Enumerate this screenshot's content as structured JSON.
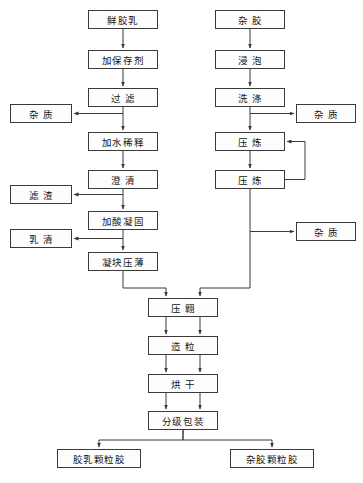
{
  "diagram": {
    "background_color": "#ffffff",
    "line_color": "#3a3a3a",
    "box_fill_color": "#fdfdfd",
    "text_color": "#141414",
    "width": 363,
    "height": 483
  },
  "nodes": {
    "fresh_latex": {
      "label": "鲜胶乳",
      "x": 88,
      "y": 10,
      "w": 70,
      "h": 19,
      "spacing": "tight"
    },
    "add_preservative": {
      "label": "加保存剂",
      "x": 88,
      "y": 50,
      "w": 70,
      "h": 19,
      "spacing": "tight"
    },
    "filtration": {
      "label": "过滤",
      "x": 88,
      "y": 88,
      "w": 70,
      "h": 19,
      "spacing": "wide"
    },
    "impurity_left": {
      "label": "杂质",
      "x": 10,
      "y": 104,
      "w": 62,
      "h": 19,
      "spacing": "wide"
    },
    "dilute_water": {
      "label": "加水稀释",
      "x": 88,
      "y": 132,
      "w": 70,
      "h": 19,
      "spacing": "tight"
    },
    "clarify": {
      "label": "澄清",
      "x": 88,
      "y": 170,
      "w": 70,
      "h": 19,
      "spacing": "wide"
    },
    "filter_residue": {
      "label": "滤渣",
      "x": 10,
      "y": 185,
      "w": 62,
      "h": 19,
      "spacing": "wide"
    },
    "acid_coagulation": {
      "label": "加酸凝固",
      "x": 88,
      "y": 211,
      "w": 70,
      "h": 19,
      "spacing": "tight"
    },
    "whey": {
      "label": "乳清",
      "x": 10,
      "y": 229,
      "w": 62,
      "h": 19,
      "spacing": "wide"
    },
    "coagulum_press": {
      "label": "凝块压薄",
      "x": 88,
      "y": 252,
      "w": 70,
      "h": 19,
      "spacing": "tight"
    },
    "scrap_rubber": {
      "label": "杂胶",
      "x": 215,
      "y": 10,
      "w": 70,
      "h": 19,
      "spacing": "wide"
    },
    "soaking": {
      "label": "浸泡",
      "x": 215,
      "y": 50,
      "w": 70,
      "h": 19,
      "spacing": "wide"
    },
    "washing": {
      "label": "洗涤",
      "x": 215,
      "y": 88,
      "w": 70,
      "h": 19,
      "spacing": "wide"
    },
    "impurity_right_top": {
      "label": "杂质",
      "x": 296,
      "y": 104,
      "w": 60,
      "h": 19,
      "spacing": "wide"
    },
    "mastication_1": {
      "label": "压炼",
      "x": 215,
      "y": 132,
      "w": 70,
      "h": 19,
      "spacing": "wide"
    },
    "mastication_2": {
      "label": "压炼",
      "x": 215,
      "y": 170,
      "w": 70,
      "h": 19,
      "spacing": "wide"
    },
    "impurity_right_bottom": {
      "label": "杂质",
      "x": 296,
      "y": 222,
      "w": 60,
      "h": 19,
      "spacing": "wide"
    },
    "crepe_press": {
      "label": "压翺",
      "x": 148,
      "y": 298,
      "w": 70,
      "h": 19,
      "spacing": "wide"
    },
    "granulation": {
      "label": "造粒",
      "x": 148,
      "y": 336,
      "w": 70,
      "h": 19,
      "spacing": "wide"
    },
    "drying": {
      "label": "烘干",
      "x": 148,
      "y": 374,
      "w": 70,
      "h": 19,
      "spacing": "wide"
    },
    "grading_packing": {
      "label": "分级包装",
      "x": 148,
      "y": 411,
      "w": 70,
      "h": 19,
      "spacing": "tight"
    },
    "latex_granular": {
      "label": "胶乳颗粒胶",
      "x": 57,
      "y": 449,
      "w": 84,
      "h": 19,
      "spacing": "tight"
    },
    "scrap_granular": {
      "label": "杂胶颗粒胶",
      "x": 230,
      "y": 449,
      "w": 84,
      "h": 19,
      "spacing": "tight"
    }
  },
  "flow_sequences": {
    "latex_line": [
      "鲜胶乳",
      "加保存剂",
      "过滤",
      "加水稀释",
      "澄清",
      "加酸凝固",
      "凝块压薄"
    ],
    "scrap_line": [
      "杂胶",
      "浸泡",
      "洗涤",
      "压炼",
      "压炼"
    ],
    "common_line": [
      "压翺",
      "造粒",
      "烘干",
      "分级包装"
    ],
    "outputs": [
      "胶乳颗粒胶",
      "杂胶颗粒胶"
    ],
    "byproducts": [
      "杂质",
      "滤渣",
      "乳清",
      "杂质",
      "杂质"
    ]
  }
}
